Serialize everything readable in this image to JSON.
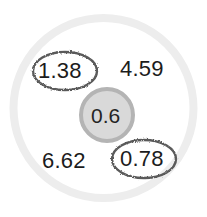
{
  "diagram": {
    "type": "circle-grouping-diagram",
    "outer_circle": {
      "name": "outer-boundary-circle",
      "stroke_color": "#ececec",
      "fill_color": "#ffffff",
      "cx": 103.5,
      "cy": 108,
      "r": 90,
      "stroke_width": 8
    },
    "center_circle": {
      "name": "center-circle",
      "label": "0.6",
      "fill_color": "#d9d9d9",
      "stroke_color": "#b4b4b4",
      "cx": 107,
      "cy": 115,
      "r": 26,
      "stroke_width": 4
    },
    "values": [
      {
        "id": "value-upper-left",
        "label": "1.38",
        "circled": true,
        "ellipse_color": "#5a5a5a",
        "x": 38,
        "y": 60,
        "ellipse": {
          "cx": 65,
          "cy": 71,
          "rx": 32,
          "ry": 19
        }
      },
      {
        "id": "value-upper-right",
        "label": "4.59",
        "circled": false,
        "ellipse_color": "",
        "x": 120,
        "y": 58,
        "ellipse": null
      },
      {
        "id": "value-lower-left",
        "label": "6.62",
        "circled": false,
        "ellipse_color": "",
        "x": 42,
        "y": 150,
        "ellipse": null
      },
      {
        "id": "value-lower-right",
        "label": "0.78",
        "circled": true,
        "ellipse_color": "#5a5a5a",
        "x": 120,
        "y": 148,
        "ellipse": {
          "cx": 144,
          "cy": 159,
          "rx": 32,
          "ry": 19
        }
      }
    ]
  }
}
